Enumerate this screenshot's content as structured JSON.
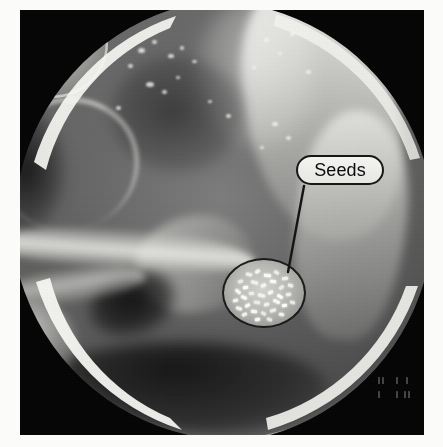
{
  "figure": {
    "modality": "radiograph",
    "view": "pelvis-anteroposterior",
    "background_color": "#fbfbfa",
    "plate_color": "#0a0a0a",
    "frame": {
      "left": 20,
      "top": 10,
      "right": 19,
      "bottom": 12
    }
  },
  "annotation": {
    "callout_label": "Seeds",
    "callout_text_color": "#0b0b0b",
    "callout_fill_color": "#efefec",
    "callout_border_color": "#171717",
    "leader_line_color": "#141414",
    "leader_from": {
      "x": 284,
      "y": 176
    },
    "leader_to": {
      "x": 268,
      "y": 262
    }
  },
  "magnifier": {
    "name": "seed-magnifier",
    "center": {
      "x": 264,
      "y": 293
    },
    "width": 84,
    "height": 70,
    "border_color": "#1b1b1b",
    "seed_color": "#fdfdfb",
    "seed_count": 34,
    "seeds": [
      {
        "x": 14,
        "y": 20,
        "w": 5,
        "h": 3,
        "r": -18
      },
      {
        "x": 22,
        "y": 13,
        "w": 6,
        "h": 3,
        "r": 12
      },
      {
        "x": 31,
        "y": 10,
        "w": 5,
        "h": 3,
        "r": -34
      },
      {
        "x": 40,
        "y": 14,
        "w": 7,
        "h": 3,
        "r": 6
      },
      {
        "x": 50,
        "y": 11,
        "w": 5,
        "h": 3,
        "r": 28
      },
      {
        "x": 58,
        "y": 17,
        "w": 6,
        "h": 3,
        "r": -10
      },
      {
        "x": 11,
        "y": 30,
        "w": 6,
        "h": 3,
        "r": 40
      },
      {
        "x": 19,
        "y": 26,
        "w": 5,
        "h": 3,
        "r": -6
      },
      {
        "x": 27,
        "y": 21,
        "w": 7,
        "h": 3,
        "r": 16
      },
      {
        "x": 37,
        "y": 24,
        "w": 5,
        "h": 3,
        "r": -26
      },
      {
        "x": 46,
        "y": 20,
        "w": 6,
        "h": 3,
        "r": 8
      },
      {
        "x": 55,
        "y": 26,
        "w": 5,
        "h": 3,
        "r": -40
      },
      {
        "x": 64,
        "y": 24,
        "w": 5,
        "h": 3,
        "r": 18
      },
      {
        "x": 9,
        "y": 39,
        "w": 5,
        "h": 3,
        "r": -14
      },
      {
        "x": 17,
        "y": 36,
        "w": 6,
        "h": 3,
        "r": 24
      },
      {
        "x": 25,
        "y": 32,
        "w": 5,
        "h": 3,
        "r": -4
      },
      {
        "x": 34,
        "y": 34,
        "w": 7,
        "h": 3,
        "r": 14
      },
      {
        "x": 44,
        "y": 31,
        "w": 5,
        "h": 3,
        "r": -22
      },
      {
        "x": 53,
        "y": 35,
        "w": 6,
        "h": 3,
        "r": 34
      },
      {
        "x": 62,
        "y": 33,
        "w": 5,
        "h": 3,
        "r": -12
      },
      {
        "x": 12,
        "y": 47,
        "w": 6,
        "h": 3,
        "r": 20
      },
      {
        "x": 21,
        "y": 44,
        "w": 5,
        "h": 3,
        "r": -30
      },
      {
        "x": 30,
        "y": 41,
        "w": 6,
        "h": 3,
        "r": 10
      },
      {
        "x": 40,
        "y": 43,
        "w": 5,
        "h": 3,
        "r": -16
      },
      {
        "x": 49,
        "y": 40,
        "w": 7,
        "h": 3,
        "r": 26
      },
      {
        "x": 58,
        "y": 44,
        "w": 5,
        "h": 3,
        "r": -8
      },
      {
        "x": 66,
        "y": 41,
        "w": 5,
        "h": 3,
        "r": 16
      },
      {
        "x": 18,
        "y": 53,
        "w": 5,
        "h": 3,
        "r": -24
      },
      {
        "x": 27,
        "y": 50,
        "w": 6,
        "h": 3,
        "r": 6
      },
      {
        "x": 37,
        "y": 52,
        "w": 5,
        "h": 3,
        "r": 32
      },
      {
        "x": 46,
        "y": 49,
        "w": 6,
        "h": 3,
        "r": -18
      },
      {
        "x": 55,
        "y": 53,
        "w": 5,
        "h": 3,
        "r": 12
      },
      {
        "x": 31,
        "y": 58,
        "w": 5,
        "h": 3,
        "r": -10
      },
      {
        "x": 43,
        "y": 58,
        "w": 5,
        "h": 3,
        "r": 22
      }
    ]
  },
  "anatomy": {
    "regions": [
      {
        "name": "iliac-bone-right",
        "label": "iliac bone"
      },
      {
        "name": "sacrum",
        "label": "sacrum"
      },
      {
        "name": "femoral-head-left",
        "label": "femoral head"
      },
      {
        "name": "acetabulum-left",
        "label": "acetabulum"
      },
      {
        "name": "obturator-foramen",
        "label": "obturator foramen"
      },
      {
        "name": "pubic-ramus",
        "label": "pubic ramus"
      },
      {
        "name": "bladder-contrast",
        "label": "contrast-filled bladder"
      }
    ]
  },
  "calcification_speckles": [
    {
      "x": 118,
      "y": 38,
      "w": 7,
      "h": 5
    },
    {
      "x": 132,
      "y": 30,
      "w": 5,
      "h": 4
    },
    {
      "x": 148,
      "y": 44,
      "w": 6,
      "h": 4
    },
    {
      "x": 160,
      "y": 36,
      "w": 4,
      "h": 4
    },
    {
      "x": 108,
      "y": 54,
      "w": 5,
      "h": 4
    },
    {
      "x": 172,
      "y": 50,
      "w": 5,
      "h": 3
    },
    {
      "x": 126,
      "y": 72,
      "w": 8,
      "h": 5
    },
    {
      "x": 142,
      "y": 80,
      "w": 5,
      "h": 4
    },
    {
      "x": 156,
      "y": 66,
      "w": 4,
      "h": 3
    },
    {
      "x": 244,
      "y": 28,
      "w": 5,
      "h": 4
    },
    {
      "x": 258,
      "y": 42,
      "w": 4,
      "h": 3
    },
    {
      "x": 270,
      "y": 22,
      "w": 5,
      "h": 4
    },
    {
      "x": 232,
      "y": 56,
      "w": 4,
      "h": 3
    },
    {
      "x": 286,
      "y": 60,
      "w": 5,
      "h": 4
    },
    {
      "x": 96,
      "y": 96,
      "w": 5,
      "h": 4
    },
    {
      "x": 188,
      "y": 90,
      "w": 4,
      "h": 3
    },
    {
      "x": 206,
      "y": 104,
      "w": 5,
      "h": 4
    },
    {
      "x": 252,
      "y": 112,
      "w": 6,
      "h": 4
    },
    {
      "x": 266,
      "y": 126,
      "w": 5,
      "h": 4
    },
    {
      "x": 240,
      "y": 136,
      "w": 4,
      "h": 3
    }
  ],
  "overlay_marks": {
    "legible": false,
    "note": "faint unreadable acquisition characters in lower-right corner",
    "glyphs": [
      {
        "x": 2,
        "y": 2,
        "w": 2,
        "h": 7
      },
      {
        "x": 6,
        "y": 2,
        "w": 2,
        "h": 7
      },
      {
        "x": 20,
        "y": 2,
        "w": 2,
        "h": 7
      },
      {
        "x": 30,
        "y": 2,
        "w": 2,
        "h": 7
      },
      {
        "x": 2,
        "y": 16,
        "w": 2,
        "h": 7
      },
      {
        "x": 20,
        "y": 16,
        "w": 2,
        "h": 7
      },
      {
        "x": 28,
        "y": 16,
        "w": 2,
        "h": 7
      },
      {
        "x": 32,
        "y": 16,
        "w": 2,
        "h": 7
      }
    ]
  }
}
